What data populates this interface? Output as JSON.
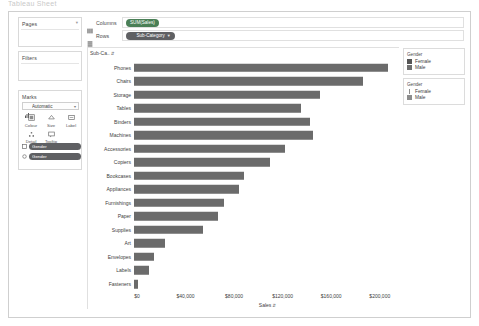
{
  "window": {
    "top_strip_text": "Tableau Sheet"
  },
  "left_panel": {
    "pages": {
      "title": "Pages",
      "collapse_icon": "chevron-icon"
    },
    "filters": {
      "title": "Filters"
    },
    "marks": {
      "title": "Marks",
      "mark_type": "Automatic",
      "buttons": [
        {
          "label": "Colour",
          "icon": "color-icon"
        },
        {
          "label": "Size",
          "icon": "size-icon"
        },
        {
          "label": "Label",
          "icon": "label-icon"
        },
        {
          "label": "Detail",
          "icon": "detail-icon"
        },
        {
          "label": "Tooltip",
          "icon": "tooltip-icon"
        }
      ],
      "pills": [
        {
          "label": "Gender",
          "icon": "color-icon"
        },
        {
          "label": "Gender",
          "icon": "size-icon"
        }
      ]
    }
  },
  "shelves": {
    "columns": {
      "name": "Columns",
      "icon": "columns-icon",
      "pill": "SUM(Sales)"
    },
    "rows": {
      "name": "Rows",
      "icon": "rows-icon",
      "pill": "Sub-Category",
      "caret": "▼"
    }
  },
  "chart": {
    "row_header": "Sub-Ca..",
    "row_header_sort": "⇵",
    "x_title": "Sales",
    "x_title_sort": "⇵"
  },
  "legends": [
    {
      "title": "Gender",
      "kind": "color",
      "items": [
        {
          "label": "Female",
          "color": "#555555"
        },
        {
          "label": "Male",
          "color": "#6f6f6f"
        }
      ]
    },
    {
      "title": "Gender",
      "kind": "size",
      "items": [
        {
          "label": "Female",
          "size": "small"
        },
        {
          "label": "Male",
          "size": "large"
        }
      ]
    }
  ],
  "chart_data": {
    "type": "bar",
    "orientation": "horizontal",
    "title": "",
    "xlabel": "Sales",
    "ylabel": "Sub-Ca..",
    "xlim": [
      0,
      215000
    ],
    "xticks": [
      0,
      40000,
      80000,
      120000,
      160000,
      200000
    ],
    "xticklabels": [
      "$0",
      "$40,000",
      "$80,000",
      "$120,000",
      "$160,000",
      "$200,000"
    ],
    "grid": false,
    "legend_position": "right",
    "bar_color": "#6b6b6b",
    "categories": [
      "Phones",
      "Chairs",
      "Storage",
      "Tables",
      "Binders",
      "Machines",
      "Accessories",
      "Copiers",
      "Bookcases",
      "Appliances",
      "Furnishings",
      "Paper",
      "Supplies",
      "Art",
      "Envelopes",
      "Labels",
      "Fasteners"
    ],
    "values": [
      205000,
      185000,
      150000,
      135000,
      142000,
      145000,
      122000,
      110000,
      89000,
      85000,
      73000,
      68000,
      56000,
      25000,
      16000,
      12000,
      3000
    ]
  }
}
